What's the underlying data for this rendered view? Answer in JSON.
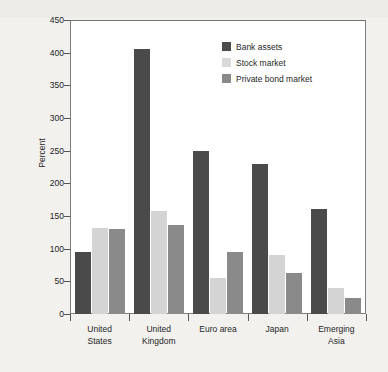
{
  "chart_data": {
    "type": "bar",
    "title": "",
    "xlabel": "",
    "ylabel": "Percent",
    "ylim": [
      0,
      450
    ],
    "ytick_step": 50,
    "yticks": [
      0,
      50,
      100,
      150,
      200,
      250,
      300,
      350,
      400,
      450
    ],
    "grid": false,
    "legend_position": "top-right",
    "categories": [
      "United\nStates",
      "United\nKingdom",
      "Euro area",
      "Japan",
      "Emerging\nAsia"
    ],
    "series": [
      {
        "name": "Bank assets",
        "color": "#4a4a4a",
        "values": [
          95,
          406,
          249,
          229,
          161
        ]
      },
      {
        "name": "Stock market",
        "color": "#d4d4d4",
        "values": [
          132,
          157,
          55,
          90,
          40
        ]
      },
      {
        "name": "Private bond market",
        "color": "#8a8a8a",
        "values": [
          130,
          136,
          95,
          63,
          25
        ]
      }
    ]
  },
  "colors": {
    "background": "#f2f1ee",
    "plot_background": "#ffffff",
    "axis": "#7d7d7d",
    "text": "#1f1f1f",
    "bank_assets": "#4a4a4a",
    "stock_market": "#d4d4d4",
    "private_bond_market": "#8a8a8a"
  }
}
